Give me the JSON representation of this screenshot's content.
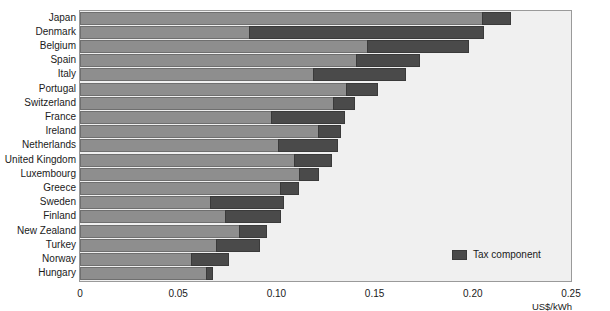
{
  "chart_data": {
    "type": "bar",
    "orientation": "horizontal",
    "title": "",
    "subtitle": "",
    "xlabel": "US$/kWh",
    "ylabel": "",
    "xlim": [
      0,
      0.25
    ],
    "xticks": [
      "0",
      "0.05",
      "0.10",
      "0.15",
      "0.20",
      "0.25"
    ],
    "xtick_values": [
      0,
      0.05,
      0.1,
      0.15,
      0.2,
      0.25
    ],
    "grid": false,
    "stacked": true,
    "legend_position": "inside-lower-right",
    "legend": [
      "Tax component"
    ],
    "categories": [
      "Japan",
      "Denmark",
      "Belgium",
      "Spain",
      "Italy",
      "Portugal",
      "Switzerland",
      "France",
      "Ireland",
      "Netherlands",
      "United Kingdom",
      "Luxembourg",
      "Greece",
      "Sweden",
      "Finland",
      "New Zealand",
      "Turkey",
      "Norway",
      "Hungary"
    ],
    "series": [
      {
        "name": "Price excluding tax",
        "color": "#8e8e8e",
        "values": [
          0.2047,
          0.0862,
          0.1462,
          0.1405,
          0.1184,
          0.1355,
          0.1289,
          0.097,
          0.1213,
          0.101,
          0.1091,
          0.1116,
          0.102,
          0.066,
          0.074,
          0.0812,
          0.0695,
          0.0563,
          0.0644
        ]
      },
      {
        "name": "Tax component",
        "color": "#4a4a4a",
        "values": [
          0.0148,
          0.1193,
          0.0518,
          0.0325,
          0.0477,
          0.0162,
          0.0112,
          0.038,
          0.0116,
          0.0304,
          0.0193,
          0.0101,
          0.0096,
          0.038,
          0.0284,
          0.0142,
          0.0223,
          0.0197,
          0.0035
        ]
      }
    ],
    "totals": [
      0.2195,
      0.2055,
      0.198,
      0.173,
      0.1661,
      0.1517,
      0.1401,
      0.135,
      0.1329,
      0.1314,
      0.1284,
      0.1217,
      0.1116,
      0.104,
      0.1024,
      0.0954,
      0.0918,
      0.076,
      0.0679
    ]
  },
  "legend": {
    "tax_label": "Tax component",
    "tax_color": "#4a4a4a"
  },
  "axis": {
    "unit_label": "US$/kWh"
  },
  "colors": {
    "base_bar": "#8e8e8e",
    "tax_bar": "#4a4a4a",
    "plot_background": "#f0f0f0",
    "page_background": "#ffffff"
  }
}
